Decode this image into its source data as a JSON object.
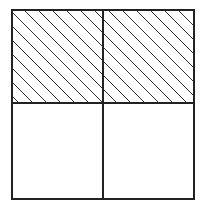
{
  "diagram": {
    "type": "fraction-grid",
    "grid": {
      "rows": 2,
      "cols": 2
    },
    "frame": {
      "x": 12,
      "y": 10,
      "width": 182,
      "height": 189
    },
    "divider": {
      "x": 103,
      "y": 103
    },
    "shaded_cells": [
      {
        "row": 0,
        "col": 0
      },
      {
        "row": 0,
        "col": 1
      }
    ],
    "shaded_fraction": "2/4",
    "hatch": {
      "angle_deg": 45,
      "direction": "top-left-to-bottom-right",
      "spacing_px": 14
    },
    "colors": {
      "stroke": "#222222",
      "hatch": "#333333",
      "background": "#ffffff"
    }
  }
}
